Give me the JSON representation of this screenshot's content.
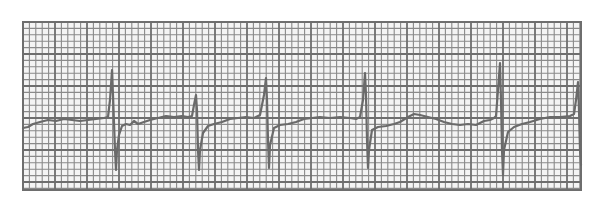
{
  "colors": {
    "background": "#ffffff",
    "paper": "#f4f4f4",
    "minor_grid": "#8a8a8a",
    "major_grid": "#6e6e6e",
    "trace": "#6a6a6a"
  },
  "grid": {
    "x0": 23,
    "y0": 22,
    "x1": 581,
    "y1": 190,
    "minor_px": 6.4,
    "major_every": 5
  },
  "trace": {
    "baseline_y": 123,
    "points": [
      [
        23,
        128
      ],
      [
        28,
        127
      ],
      [
        33,
        124
      ],
      [
        40,
        122
      ],
      [
        48,
        120
      ],
      [
        56,
        121
      ],
      [
        64,
        119
      ],
      [
        72,
        120
      ],
      [
        80,
        121
      ],
      [
        88,
        120
      ],
      [
        96,
        119
      ],
      [
        104,
        118
      ],
      [
        108,
        117
      ],
      [
        110,
        100
      ],
      [
        112,
        70
      ],
      [
        113,
        95
      ],
      [
        115,
        150
      ],
      [
        116,
        170
      ],
      [
        117,
        150
      ],
      [
        119,
        135
      ],
      [
        122,
        126
      ],
      [
        126,
        124
      ],
      [
        130,
        125
      ],
      [
        134,
        121
      ],
      [
        138,
        124
      ],
      [
        144,
        122
      ],
      [
        150,
        120
      ],
      [
        158,
        118
      ],
      [
        166,
        116
      ],
      [
        174,
        117
      ],
      [
        182,
        116
      ],
      [
        188,
        117
      ],
      [
        192,
        116
      ],
      [
        194,
        105
      ],
      [
        196,
        95
      ],
      [
        197,
        110
      ],
      [
        198,
        150
      ],
      [
        199,
        170
      ],
      [
        200,
        150
      ],
      [
        203,
        133
      ],
      [
        208,
        126
      ],
      [
        214,
        124
      ],
      [
        222,
        122
      ],
      [
        230,
        119
      ],
      [
        238,
        118
      ],
      [
        246,
        117
      ],
      [
        254,
        118
      ],
      [
        260,
        115
      ],
      [
        264,
        95
      ],
      [
        266,
        78
      ],
      [
        267,
        100
      ],
      [
        268,
        140
      ],
      [
        269,
        168
      ],
      [
        270,
        145
      ],
      [
        274,
        128
      ],
      [
        280,
        125
      ],
      [
        288,
        124
      ],
      [
        296,
        122
      ],
      [
        304,
        119
      ],
      [
        312,
        118
      ],
      [
        320,
        117
      ],
      [
        330,
        118
      ],
      [
        340,
        117
      ],
      [
        350,
        118
      ],
      [
        356,
        119
      ],
      [
        360,
        117
      ],
      [
        363,
        100
      ],
      [
        365,
        73
      ],
      [
        366,
        95
      ],
      [
        367,
        140
      ],
      [
        368,
        168
      ],
      [
        369,
        150
      ],
      [
        372,
        130
      ],
      [
        378,
        127
      ],
      [
        386,
        126
      ],
      [
        394,
        124
      ],
      [
        400,
        122
      ],
      [
        408,
        117
      ],
      [
        414,
        114
      ],
      [
        420,
        115
      ],
      [
        428,
        117
      ],
      [
        436,
        119
      ],
      [
        444,
        122
      ],
      [
        452,
        124
      ],
      [
        460,
        125
      ],
      [
        468,
        124
      ],
      [
        476,
        125
      ],
      [
        484,
        121
      ],
      [
        490,
        120
      ],
      [
        494,
        118
      ],
      [
        496,
        116
      ],
      [
        498,
        90
      ],
      [
        500,
        63
      ],
      [
        501,
        100
      ],
      [
        502,
        150
      ],
      [
        503,
        175
      ],
      [
        504,
        150
      ],
      [
        508,
        132
      ],
      [
        514,
        127
      ],
      [
        522,
        124
      ],
      [
        530,
        122
      ],
      [
        540,
        119
      ],
      [
        550,
        117
      ],
      [
        560,
        117
      ],
      [
        570,
        116
      ],
      [
        574,
        114
      ],
      [
        576,
        100
      ],
      [
        578,
        82
      ],
      [
        579,
        110
      ],
      [
        580,
        150
      ],
      [
        581,
        165
      ]
    ]
  },
  "beats": [
    {
      "r_x": 112,
      "r_y": 70,
      "s_y": 170
    },
    {
      "r_x": 196,
      "r_y": 95,
      "s_y": 170
    },
    {
      "r_x": 266,
      "r_y": 78,
      "s_y": 168
    },
    {
      "r_x": 365,
      "r_y": 73,
      "s_y": 168
    },
    {
      "r_x": 500,
      "r_y": 63,
      "s_y": 175
    },
    {
      "r_x": 578,
      "r_y": 82,
      "s_y": 165
    }
  ]
}
